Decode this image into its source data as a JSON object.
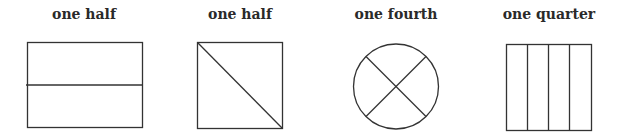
{
  "figures": [
    {
      "label": "one half",
      "shape": "rectangle",
      "division": "horizontal line into 2 parts"
    },
    {
      "label": "one half",
      "shape": "square",
      "division": "diagonal line into 2 parts"
    },
    {
      "label": "one fourth",
      "shape": "circle",
      "division": "two crossing diagonals into 4 parts"
    },
    {
      "label": "one quarter",
      "shape": "rectangle",
      "division": "3 vertical lines into 4 parts"
    }
  ],
  "colors": {
    "stroke": "#333333",
    "background": "#ffffff",
    "text": "#2a2a2a"
  }
}
